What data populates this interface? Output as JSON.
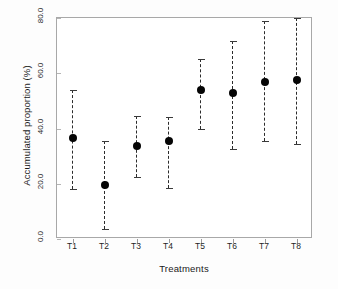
{
  "chart_data": {
    "type": "scatter",
    "title": "",
    "xlabel": "Treatments",
    "ylabel": "Accumulated proportion (%)",
    "categories": [
      "T1",
      "T2",
      "T3",
      "T4",
      "T5",
      "T6",
      "T7",
      "T8"
    ],
    "values": [
      36.5,
      19.5,
      33.5,
      35.5,
      54.0,
      53.0,
      57.0,
      57.5
    ],
    "error_low": [
      18.0,
      3.5,
      22.5,
      18.5,
      40.0,
      32.5,
      35.5,
      34.5
    ],
    "error_high": [
      54.0,
      35.5,
      44.5,
      44.0,
      65.0,
      71.5,
      79.0,
      80.0
    ],
    "ylim": [
      0.0,
      80.0
    ],
    "ytick_labels": [
      "0.0",
      "20.0",
      "40.0",
      "60.0",
      "80.0"
    ],
    "ytick_values": [
      0.0,
      20.0,
      40.0,
      60.0,
      80.0
    ],
    "grid": false,
    "legend": null,
    "marker_color": "#050505",
    "errorbar_color": "#2b2b2b",
    "axis_color": "#a8a8a8",
    "series_name": "Accumulated proportion"
  }
}
